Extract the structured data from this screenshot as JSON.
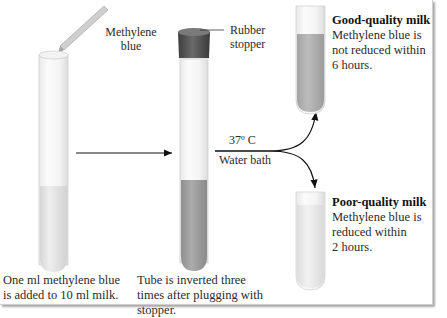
{
  "figure": {
    "colors": {
      "milk": "#e4e4e4",
      "mixed_blue": "#a7a7a7",
      "good_quality_tube": "#b5b5b5",
      "poor_quality_tube": "#ebebeb",
      "stopper": "#555555",
      "text": "#2b2b2b"
    },
    "labels": {
      "methylene_blue": [
        "Methylene",
        "blue"
      ],
      "rubber_stopper": [
        "Rubber",
        "stopper"
      ],
      "temperature": "37º C",
      "water_bath": "Water bath"
    },
    "steps": [
      {
        "caption": [
          "One ml methylene blue",
          "is added to 10 ml milk."
        ]
      },
      {
        "caption": [
          "Tube is inverted three",
          "times after plugging with",
          "stopper."
        ]
      }
    ],
    "outcomes": [
      {
        "title": "Good-quality milk",
        "text": [
          "Methylene blue is",
          "not reduced within",
          "6 hours."
        ]
      },
      {
        "title": "Poor-quality milk",
        "text": [
          "Methylene blue is",
          "reduced within",
          "2 hours."
        ]
      }
    ]
  }
}
